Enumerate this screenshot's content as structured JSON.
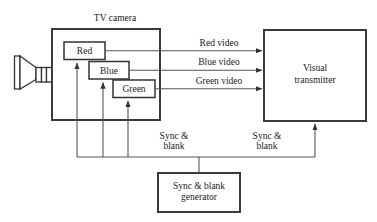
{
  "diagram": {
    "type": "block-diagram",
    "background_color": "#ffffff",
    "line_color": "#333333",
    "text_color": "#1a1a1a"
  },
  "camera": {
    "title": "TV camera",
    "lens_icon": "camera-lens-icon",
    "channels": [
      {
        "id": "red",
        "label": "Red"
      },
      {
        "id": "blue",
        "label": "Blue"
      },
      {
        "id": "green",
        "label": "Green"
      }
    ]
  },
  "signals": {
    "video": [
      {
        "id": "red-video",
        "label": "Red video"
      },
      {
        "id": "blue-video",
        "label": "Blue video"
      },
      {
        "id": "green-video",
        "label": "Green video"
      }
    ],
    "sync_camera": {
      "line1": "Sync &",
      "line2": "blank"
    },
    "sync_transmitter": {
      "line1": "Sync &",
      "line2": "blank"
    }
  },
  "transmitter": {
    "line1": "Visual",
    "line2": "transmitter"
  },
  "generator": {
    "line1": "Sync & blank",
    "line2": "generator"
  }
}
